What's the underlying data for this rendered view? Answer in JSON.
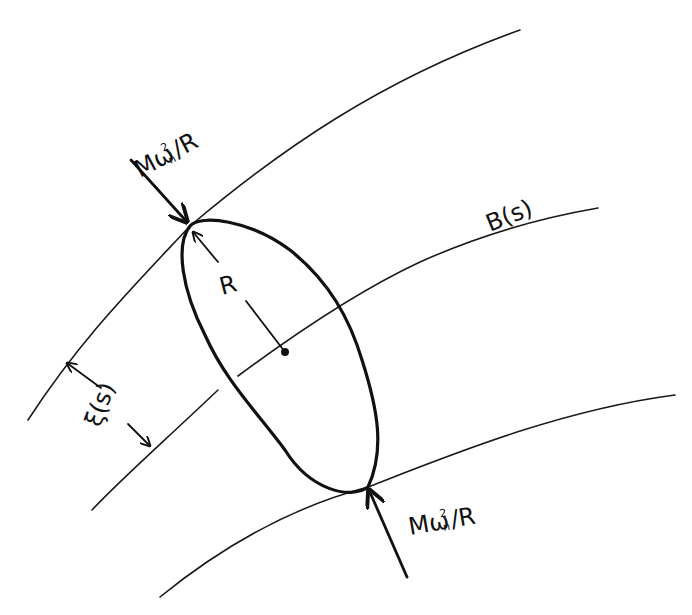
{
  "diagram": {
    "type": "hand-drawn physics sketch",
    "colors": {
      "ink": "#111111",
      "background": "#ffffff"
    },
    "curves": {
      "upper_boundary": {
        "label": ""
      },
      "centerline": {
        "label": "B(s)"
      },
      "lower_boundary": {
        "label": ""
      }
    },
    "labels": {
      "force_top": "Mω",
      "force_top_sub": "n",
      "force_top_sup": "2",
      "force_top_tail": "/R",
      "force_bottom": "Mω",
      "force_bottom_sub": "n",
      "force_bottom_sup": "2",
      "force_bottom_tail": "/R",
      "radius": "R",
      "centerline": "B(s)",
      "half_width": "ξ(s)"
    }
  }
}
